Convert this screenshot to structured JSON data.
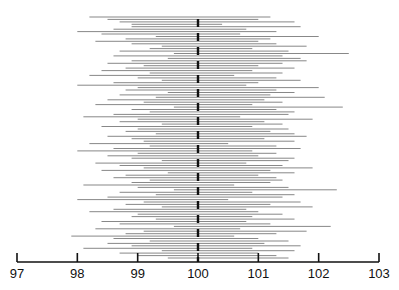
{
  "chart_data": {
    "type": "interval",
    "title": "",
    "xlabel": "",
    "ylabel": "",
    "xlim": [
      97,
      103
    ],
    "x_ticks": [
      97,
      98,
      99,
      100,
      101,
      102,
      103
    ],
    "x_tick_labels": [
      "97",
      "98",
      "99",
      "100",
      "101",
      "102",
      "103"
    ],
    "reference_line": 100,
    "reference_style": "dashed-bold",
    "grid": false,
    "legend": null,
    "series": [
      {
        "name": "confidence intervals",
        "intervals": [
          [
            98.2,
            101.2
          ],
          [
            98.5,
            101.0
          ],
          [
            98.7,
            101.6
          ],
          [
            98.9,
            100.4
          ],
          [
            98.9,
            101.7
          ],
          [
            98.6,
            100.8
          ],
          [
            98.0,
            101.3
          ],
          [
            98.4,
            100.7
          ],
          [
            99.3,
            102.0
          ],
          [
            98.8,
            101.2
          ],
          [
            98.3,
            101.0
          ],
          [
            98.9,
            101.3
          ],
          [
            99.4,
            101.8
          ],
          [
            99.2,
            100.9
          ],
          [
            98.7,
            101.5
          ],
          [
            99.6,
            102.5
          ],
          [
            98.6,
            101.4
          ],
          [
            99.5,
            101.7
          ],
          [
            98.9,
            101.8
          ],
          [
            98.5,
            101.4
          ],
          [
            99.1,
            101.0
          ],
          [
            98.8,
            101.6
          ],
          [
            98.4,
            100.9
          ],
          [
            99.2,
            101.4
          ],
          [
            98.2,
            100.6
          ],
          [
            99.0,
            101.3
          ],
          [
            99.4,
            101.7
          ],
          [
            98.6,
            101.0
          ],
          [
            98.0,
            100.8
          ],
          [
            99.0,
            102.0
          ],
          [
            98.8,
            101.3
          ],
          [
            99.5,
            101.6
          ],
          [
            98.7,
            101.2
          ],
          [
            99.3,
            102.1
          ],
          [
            98.5,
            101.1
          ],
          [
            99.1,
            101.4
          ],
          [
            98.3,
            100.9
          ],
          [
            99.6,
            102.4
          ],
          [
            98.9,
            101.3
          ],
          [
            99.2,
            101.6
          ],
          [
            98.6,
            101.5
          ],
          [
            98.1,
            100.7
          ],
          [
            99.0,
            101.9
          ],
          [
            98.7,
            101.1
          ],
          [
            99.4,
            101.4
          ],
          [
            98.4,
            100.9
          ],
          [
            99.0,
            101.5
          ],
          [
            98.8,
            101.2
          ],
          [
            99.3,
            101.6
          ],
          [
            98.5,
            101.8
          ],
          [
            98.9,
            101.1
          ],
          [
            99.1,
            101.6
          ],
          [
            98.2,
            100.5
          ],
          [
            99.2,
            101.3
          ],
          [
            98.6,
            101.7
          ],
          [
            98.0,
            100.9
          ],
          [
            99.0,
            101.3
          ],
          [
            98.5,
            101.0
          ],
          [
            98.9,
            101.6
          ],
          [
            99.4,
            101.5
          ],
          [
            98.3,
            100.8
          ],
          [
            98.7,
            101.4
          ],
          [
            99.1,
            101.9
          ],
          [
            98.4,
            101.2
          ],
          [
            99.5,
            101.6
          ],
          [
            98.8,
            101.0
          ],
          [
            98.6,
            101.3
          ],
          [
            99.2,
            101.4
          ],
          [
            98.9,
            101.2
          ],
          [
            98.1,
            100.6
          ],
          [
            99.0,
            101.5
          ],
          [
            99.6,
            102.3
          ],
          [
            98.7,
            100.9
          ],
          [
            99.3,
            101.6
          ],
          [
            98.5,
            101.4
          ],
          [
            98.0,
            100.5
          ],
          [
            99.1,
            101.7
          ],
          [
            98.8,
            101.2
          ],
          [
            99.4,
            101.9
          ],
          [
            98.6,
            100.8
          ],
          [
            98.2,
            101.0
          ],
          [
            99.0,
            101.4
          ],
          [
            98.9,
            100.9
          ],
          [
            99.3,
            101.6
          ],
          [
            98.4,
            100.8
          ],
          [
            98.7,
            101.2
          ],
          [
            99.6,
            102.2
          ],
          [
            98.3,
            100.7
          ],
          [
            99.1,
            101.8
          ],
          [
            98.8,
            101.3
          ],
          [
            97.9,
            100.6
          ],
          [
            98.6,
            101.0
          ],
          [
            99.2,
            101.5
          ],
          [
            98.5,
            101.1
          ],
          [
            98.9,
            101.7
          ],
          [
            98.1,
            100.9
          ],
          [
            99.4,
            101.6
          ],
          [
            98.7,
            101.0
          ],
          [
            99.0,
            101.3
          ],
          [
            99.5,
            101.5
          ]
        ]
      }
    ]
  }
}
